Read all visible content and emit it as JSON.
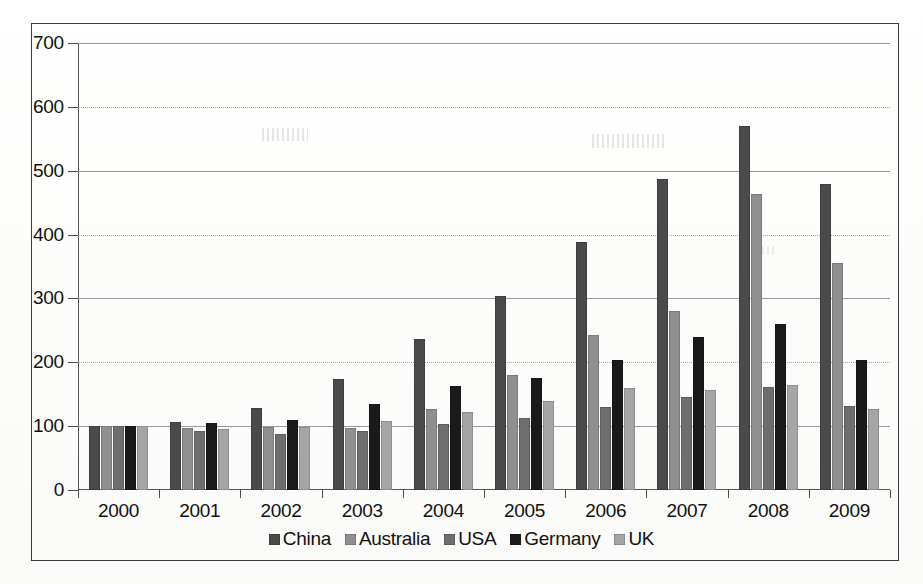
{
  "chart_data": {
    "type": "bar",
    "title": "",
    "subtitle": "",
    "xlabel": "",
    "ylabel": "",
    "categories": [
      "2000",
      "2001",
      "2002",
      "2003",
      "2004",
      "2005",
      "2006",
      "2007",
      "2008",
      "2009"
    ],
    "ylim": [
      0,
      700
    ],
    "y_ticks": [
      0,
      100,
      200,
      300,
      400,
      500,
      600,
      700
    ],
    "y_tick_labels": [
      "0",
      "100",
      "200",
      "300",
      "400",
      "500",
      "600",
      "700"
    ],
    "grid": true,
    "legend_position": "bottom",
    "series": [
      {
        "name": "China",
        "color": "#4a4a4a",
        "values": [
          100,
          106,
          128,
          174,
          237,
          304,
          388,
          487,
          570,
          480
        ]
      },
      {
        "name": "Australia",
        "color": "#8f8f8f",
        "values": [
          100,
          97,
          99,
          97,
          127,
          180,
          243,
          280,
          463,
          355
        ]
      },
      {
        "name": "USA",
        "color": "#6e6e6e",
        "values": [
          100,
          92,
          88,
          92,
          103,
          113,
          130,
          146,
          162,
          132
        ]
      },
      {
        "name": "Germany",
        "color": "#1a1a1a",
        "values": [
          100,
          105,
          110,
          134,
          163,
          176,
          203,
          239,
          260,
          203
        ]
      },
      {
        "name": "UK",
        "color": "#a5a5a5",
        "values": [
          100,
          96,
          99,
          108,
          122,
          139,
          160,
          156,
          165,
          127
        ]
      }
    ]
  },
  "legend": {
    "items": [
      {
        "label": "China",
        "swatch": "#4a4a4a"
      },
      {
        "label": "Australia",
        "swatch": "#8f8f8f"
      },
      {
        "label": "USA",
        "swatch": "#6e6e6e"
      },
      {
        "label": "Germany",
        "swatch": "#1a1a1a"
      },
      {
        "label": "UK",
        "swatch": "#a5a5a5"
      }
    ]
  },
  "style": {
    "axis_color": "#555555",
    "grid_color": "#9a9a9a",
    "text_color": "#111111",
    "frame_color": "#3b3b3b",
    "background": "#fdfdfc"
  }
}
